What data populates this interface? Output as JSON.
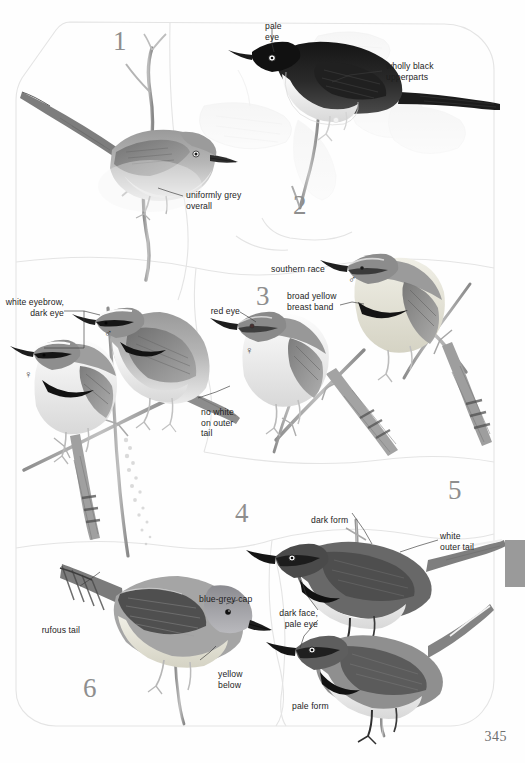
{
  "page": {
    "number": "345",
    "bleed_text": "",
    "thumb_tab_color": "#9a9a9a",
    "plate_number_color": "#8e8e8e",
    "label_color": "#1d1d1d"
  },
  "plates": [
    {
      "id": 1,
      "number": "1"
    },
    {
      "id": 2,
      "number": "2"
    },
    {
      "id": 3,
      "number": "3"
    },
    {
      "id": 4,
      "number": "4"
    },
    {
      "id": 5,
      "number": "5"
    },
    {
      "id": 6,
      "number": "6"
    }
  ],
  "labels": {
    "pale_eye": "pale\neye",
    "wholly_black_upperparts": "wholly black\nupperparts",
    "uniformly_grey_overall": "uniformly grey\noverall",
    "white_eyebrow_dark_eye": "white eyebrow,\ndark eye",
    "no_white_on_outer_tail": "no white\non outer\ntail",
    "southern_race": "southern race",
    "red_eye": "red eye",
    "broad_yellow_breast_band": "broad yellow\nbreast band",
    "dark_form": "dark form",
    "white_outer_tail": "white\nouter tail",
    "dark_face_pale_eye": "dark face,\npale eye",
    "pale_form": "pale form",
    "blue_grey_cap": "blue-grey cap",
    "rufous_tail": "rufous tail",
    "yellow_below": "yellow\nbelow"
  },
  "sex_symbols": {
    "plate4_female": "♀",
    "plate4_male": "♂",
    "plate3_female": "♀",
    "plate3_male": "♂"
  }
}
